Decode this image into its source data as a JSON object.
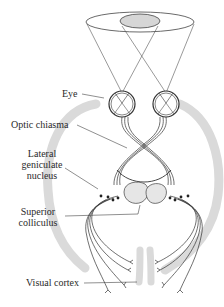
{
  "diagram": {
    "type": "anatomical illustration",
    "labels": {
      "eye": "Eye",
      "optic_chiasma": "Optic chiasma",
      "lateral_geniculate_nucleus_line1": "Lateral",
      "lateral_geniculate_nucleus_line2": "geniculate",
      "lateral_geniculate_nucleus_line3": "nucleus",
      "superior_colliculus_line1": "Superior",
      "superior_colliculus_line2": "colliculus",
      "visual_cortex": "Visual cortex"
    },
    "colors": {
      "line": "#333333",
      "brain_outline": "#d9d9d9",
      "visual_field_overlap": "#d6d6d6",
      "background": "#ffffff"
    }
  }
}
